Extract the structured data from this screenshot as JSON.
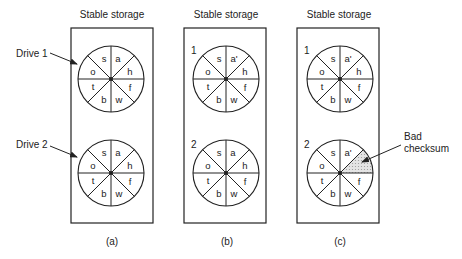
{
  "figure": {
    "panels": [
      {
        "id": "a",
        "title": "Stable storage",
        "caption": "(a)",
        "drives": [
          {
            "label": "Drive 1",
            "sectors": [
              "s",
              "a",
              "h",
              "f",
              "w",
              "b",
              "t",
              "o"
            ],
            "bad_sector": null
          },
          {
            "label": "Drive 2",
            "sectors": [
              "s",
              "a",
              "h",
              "f",
              "w",
              "b",
              "t",
              "o"
            ],
            "bad_sector": null
          }
        ]
      },
      {
        "id": "b",
        "title": "Stable storage",
        "caption": "(b)",
        "drives": [
          {
            "label": "1",
            "sectors": [
              "s",
              "a'",
              "h",
              "f",
              "w",
              "b",
              "t",
              "o"
            ],
            "bad_sector": null
          },
          {
            "label": "2",
            "sectors": [
              "s",
              "a",
              "h",
              "f",
              "w",
              "b",
              "t",
              "o"
            ],
            "bad_sector": null
          }
        ]
      },
      {
        "id": "c",
        "title": "Stable storage",
        "caption": "(c)",
        "drives": [
          {
            "label": "1",
            "sectors": [
              "s",
              "a'",
              "h",
              "f",
              "w",
              "b",
              "t",
              "o"
            ],
            "bad_sector": null
          },
          {
            "label": "2",
            "sectors": [
              "s",
              "a'",
              "",
              "f",
              "w",
              "b",
              "t",
              "o"
            ],
            "bad_sector": 2
          }
        ],
        "annotation": {
          "line1": "Bad",
          "line2": "checksum"
        }
      }
    ],
    "colors": {
      "stroke": "#222222",
      "bad_fill": "#d6d6d6",
      "background": "#ffffff"
    }
  }
}
